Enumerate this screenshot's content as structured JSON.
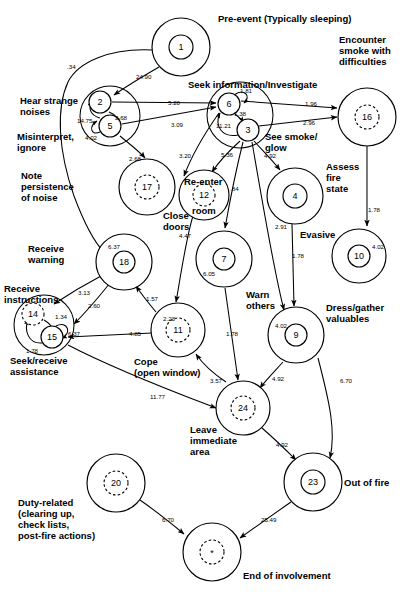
{
  "diagram": {
    "type": "state-transition-network",
    "node_style": {
      "solid_inner": "visited/active state",
      "dashed_inner": "terminal or optional state",
      "outer_ring": "state boundary"
    }
  },
  "nodes": [
    {
      "id": "1",
      "label": "Pre-event (Typically sleeping)",
      "x": 181,
      "y": 47,
      "r_outer": 29,
      "r_inner": 12,
      "dashed": false
    },
    {
      "id": "2",
      "label": "Hear strange noises",
      "x": 100,
      "y": 102,
      "r_outer": 0,
      "r_inner": 11,
      "dashed": false
    },
    {
      "id": "5",
      "label": "Misinterpret, ignore",
      "x": 110,
      "y": 126,
      "r_outer": 0,
      "r_inner": 11,
      "dashed": false
    },
    {
      "id": "6",
      "label": "Seek information/Investigate",
      "x": 229,
      "y": 104,
      "r_outer": 0,
      "r_inner": 11,
      "dashed": false
    },
    {
      "id": "3",
      "label": "See smoke/ glow",
      "x": 248,
      "y": 130,
      "r_outer": 0,
      "r_inner": 11,
      "dashed": false
    },
    {
      "id": "16",
      "label": "Encounter smoke with difficulties",
      "x": 367,
      "y": 117,
      "r_outer": 29,
      "r_inner": 12,
      "dashed": true
    },
    {
      "id": "17",
      "label": "Note persistence of noise",
      "x": 147,
      "y": 187,
      "r_outer": 28,
      "r_inner": 12,
      "dashed": true
    },
    {
      "id": "12",
      "label": "Re-enter room",
      "x": 204,
      "y": 195,
      "r_outer": 25,
      "r_inner": 11,
      "dashed": true
    },
    {
      "id": "4",
      "label": "Assess fire state",
      "x": 295,
      "y": 196,
      "r_outer": 28,
      "r_inner": 12,
      "dashed": false
    },
    {
      "id": "18",
      "label": "Receive warning",
      "x": 124,
      "y": 262,
      "r_outer": 28,
      "r_inner": 11,
      "dashed": false
    },
    {
      "id": "7",
      "label": "Warn others",
      "x": 224,
      "y": 259,
      "r_outer": 28,
      "r_inner": 11,
      "dashed": false
    },
    {
      "id": "10",
      "label": "Evasive",
      "x": 359,
      "y": 256,
      "r_outer": 27,
      "r_inner": 11,
      "dashed": false
    },
    {
      "id": "14",
      "label": "Receive instructions",
      "x": 33,
      "y": 314,
      "r_outer": 0,
      "r_inner": 11,
      "dashed": true
    },
    {
      "id": "15",
      "label": "Seek/receive assistance",
      "x": 52,
      "y": 337,
      "r_outer": 0,
      "r_inner": 11,
      "dashed": false
    },
    {
      "id": "11",
      "label": "Cope (open window)",
      "x": 178,
      "y": 330,
      "r_outer": 27,
      "r_inner": 12,
      "dashed": true
    },
    {
      "id": "9",
      "label": "Dress/gather valuables",
      "x": 296,
      "y": 335,
      "r_outer": 28,
      "r_inner": 11,
      "dashed": false
    },
    {
      "id": "24",
      "label": "Leave immediate area",
      "x": 243,
      "y": 408,
      "r_outer": 27,
      "r_inner": 12,
      "dashed": true
    },
    {
      "id": "23",
      "label": "Out of fire",
      "x": 313,
      "y": 482,
      "r_outer": 29,
      "r_inner": 12,
      "dashed": false
    },
    {
      "id": "20",
      "label": "Duty-related (clearing up, check lists, post-fire actions)",
      "x": 116,
      "y": 483,
      "r_outer": 29,
      "r_inner": 12,
      "dashed": true
    },
    {
      "id": "*",
      "label": "End of involvement",
      "x": 212,
      "y": 552,
      "r_outer": 29,
      "r_inner": 12,
      "dashed": true
    }
  ],
  "node_labels": [
    {
      "text": "Pre-event (Typically sleeping)",
      "x": 218,
      "y": 13,
      "align": "left"
    },
    {
      "text": "Encounter\nsmoke with\ndifficulties",
      "x": 339,
      "y": 34,
      "align": "left"
    },
    {
      "text": "Seek information/Investigate",
      "x": 188,
      "y": 79,
      "align": "left"
    },
    {
      "text": "Hear strange\nnoises",
      "x": 20,
      "y": 95,
      "align": "left"
    },
    {
      "text": "Misinterpret,\nignore",
      "x": 17,
      "y": 131,
      "align": "left"
    },
    {
      "text": "See smoke/\nglow",
      "x": 265,
      "y": 131,
      "align": "left"
    },
    {
      "text": "Assess\nfire\nstate",
      "x": 326,
      "y": 161,
      "align": "left"
    },
    {
      "text": "Note\npersistence\nof noise",
      "x": 21,
      "y": 170,
      "align": "left"
    },
    {
      "text": "Re-enter",
      "x": 184,
      "y": 176,
      "align": "left"
    },
    {
      "text": "room",
      "x": 192,
      "y": 205,
      "align": "left"
    },
    {
      "text": "Close\ndoors",
      "x": 163,
      "y": 210,
      "align": "left"
    },
    {
      "text": "Evasive",
      "x": 300,
      "y": 229,
      "align": "left"
    },
    {
      "text": "Receive\nwarning",
      "x": 28,
      "y": 243,
      "align": "left"
    },
    {
      "text": "Warn\nothers",
      "x": 246,
      "y": 289,
      "align": "left"
    },
    {
      "text": "Receive\ninstructions",
      "x": 4,
      "y": 283,
      "align": "left"
    },
    {
      "text": "Dress/gather\nvaluables",
      "x": 326,
      "y": 302,
      "align": "left"
    },
    {
      "text": "Cope\n(open window)",
      "x": 134,
      "y": 356,
      "align": "left"
    },
    {
      "text": "Seek/receive\nassistance",
      "x": 10,
      "y": 355,
      "align": "left"
    },
    {
      "text": "Leave\nimmediate\narea",
      "x": 190,
      "y": 424,
      "align": "left"
    },
    {
      "text": "Out of fire",
      "x": 344,
      "y": 477,
      "align": "left"
    },
    {
      "text": "Duty-related\n(clearing up,\ncheck lists,\npost-fire actions)",
      "x": 18,
      "y": 497,
      "align": "left"
    },
    {
      "text": "End of involvement",
      "x": 243,
      "y": 570,
      "align": "left"
    }
  ],
  "edges": [
    {
      "from": "1",
      "to": "18",
      "weight": ".34",
      "lx": 67,
      "ly": 63
    },
    {
      "from": "1",
      "to": "2",
      "weight": "24.90",
      "lx": 136,
      "ly": 73
    },
    {
      "from": "2",
      "to": "6",
      "weight": "5.20",
      "lx": 168,
      "ly": 99
    },
    {
      "from": "5",
      "to": "6",
      "weight": "3.09",
      "lx": 171,
      "ly": 121
    },
    {
      "from": "2",
      "to": "5",
      "weight": "2.68",
      "lx": 115,
      "ly": 114
    },
    {
      "from": "5",
      "to": "2",
      "weight": "14.75",
      "lx": 77,
      "ly": 117
    },
    {
      "from": "5",
      "to": "5",
      "weight": "4.02",
      "lx": 85,
      "ly": 134
    },
    {
      "from": "5",
      "to": "17",
      "weight": "2.68",
      "lx": 129,
      "ly": 155
    },
    {
      "from": "6",
      "to": "6",
      "weight": "1.81",
      "lx": 240,
      "ly": 87
    },
    {
      "from": "6",
      "to": "3",
      "weight": "1.38",
      "lx": 234,
      "ly": 110
    },
    {
      "from": "3",
      "to": "6",
      "weight": "11.21",
      "lx": 216,
      "ly": 122
    },
    {
      "from": "6",
      "to": "16",
      "weight": "1.96",
      "lx": 305,
      "ly": 100
    },
    {
      "from": "3",
      "to": "16",
      "weight": "2.96",
      "lx": 303,
      "ly": 119
    },
    {
      "from": "6",
      "to": "12",
      "weight": "3.20",
      "lx": 179,
      "ly": 152
    },
    {
      "from": "3",
      "to": "12",
      "weight": "5.36",
      "lx": 221,
      "ly": 151
    },
    {
      "from": "3",
      "to": "7",
      "weight": ".84",
      "lx": 230,
      "ly": 185
    },
    {
      "from": "3",
      "to": "4",
      "weight": "4.92",
      "lx": 264,
      "ly": 152
    },
    {
      "from": "3",
      "to": "9",
      "weight": "2.91",
      "lx": 275,
      "ly": 223
    },
    {
      "from": "16",
      "to": "10",
      "weight": "1.78",
      "lx": 368,
      "ly": 206
    },
    {
      "from": "4",
      "to": "9",
      "weight": "1.78",
      "lx": 292,
      "ly": 252
    },
    {
      "from": "10",
      "to": "10",
      "weight": "4.02",
      "lx": 372,
      "ly": 243
    },
    {
      "from": "12",
      "to": "11",
      "weight": "4.47",
      "lx": 179,
      "ly": 232
    },
    {
      "from": "7",
      "to": "7",
      "weight": "6.05",
      "lx": 203,
      "ly": 270
    },
    {
      "from": "11",
      "to": "11",
      "weight": "2.23",
      "lx": 163,
      "ly": 315
    },
    {
      "from": "9",
      "to": "9",
      "weight": "4.02",
      "lx": 275,
      "ly": 322
    },
    {
      "from": "18",
      "to": "18",
      "weight": "6.37",
      "lx": 108,
      "ly": 243
    },
    {
      "from": "18",
      "to": "14",
      "weight": "3.13",
      "lx": 78,
      "ly": 289
    },
    {
      "from": "18",
      "to": "15",
      "weight": "2.60",
      "lx": 88,
      "ly": 302
    },
    {
      "from": "11",
      "to": "18",
      "weight": "1.57",
      "lx": 146,
      "ly": 295
    },
    {
      "from": "11",
      "to": "15",
      "weight": "4.85",
      "lx": 129,
      "ly": 330
    },
    {
      "from": "14",
      "to": "15",
      "weight": "1.34",
      "lx": 55,
      "ly": 313
    },
    {
      "from": "15",
      "to": "14",
      "weight": "1.78",
      "lx": 26,
      "ly": 347
    },
    {
      "from": "15",
      "to": "15",
      "weight": "6.37",
      "lx": 68,
      "ly": 330
    },
    {
      "from": "15",
      "to": "24",
      "weight": "11.77",
      "lx": 150,
      "ly": 393
    },
    {
      "from": "11",
      "to": "24",
      "weight": "3.57",
      "lx": 210,
      "ly": 377
    },
    {
      "from": "7",
      "to": "24",
      "weight": "1.78",
      "lx": 226,
      "ly": 330
    },
    {
      "from": "9",
      "to": "24",
      "weight": "4.92",
      "lx": 272,
      "ly": 375
    },
    {
      "from": "24",
      "to": "23",
      "weight": "4.92",
      "lx": 276,
      "ly": 441
    },
    {
      "from": "9",
      "to": "23",
      "weight": "6.70",
      "lx": 340,
      "ly": 377
    },
    {
      "from": "20",
      "to": "*",
      "weight": "6.70",
      "lx": 162,
      "ly": 516
    },
    {
      "from": "23",
      "to": "*",
      "weight": "25.49",
      "lx": 261,
      "ly": 516
    }
  ]
}
